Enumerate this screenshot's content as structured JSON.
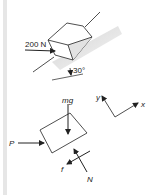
{
  "figure": {
    "top_diagram": {
      "description": "Block on incline pushed by horizontal force",
      "force_label": "200 N",
      "angle_label": "30°"
    },
    "free_body_diagram": {
      "labels": {
        "weight": "mg",
        "push": "P",
        "friction": "f",
        "normal": "N"
      }
    },
    "axes": {
      "x_label": "x",
      "y_label": "y"
    },
    "colors": {
      "line": "#222222",
      "incline_shade": "#d8d8d8",
      "side_bar": "#e6e6e6"
    }
  }
}
